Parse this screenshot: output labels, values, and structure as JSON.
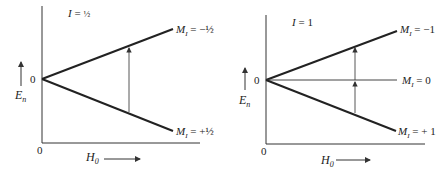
{
  "panels": [
    {
      "id": "left",
      "spin_label": "I = ½",
      "spin_I": "I",
      "spin_eq": " = ",
      "spin_value": "½",
      "y_axis_label": "E",
      "y_axis_sub": "n",
      "x_axis_label": "H",
      "x_axis_sub": "0",
      "origin_y_label": "0",
      "origin_x_label": "0",
      "levels": [
        {
          "M": "M",
          "sub": "I",
          "value": " = −½",
          "direction": "up"
        },
        {
          "M": "M",
          "sub": "I",
          "value": " = +½",
          "direction": "down"
        }
      ],
      "transition_arrow": "single"
    },
    {
      "id": "right",
      "spin_label": "I = 1",
      "spin_I": "I",
      "spin_eq": " = ",
      "spin_value": "1",
      "y_axis_label": "E",
      "y_axis_sub": "n",
      "x_axis_label": "H",
      "x_axis_sub": "0",
      "origin_y_label": "0",
      "origin_x_label": "0",
      "levels": [
        {
          "M": "M",
          "sub": "I",
          "value": " = −1",
          "direction": "up"
        },
        {
          "M": "M",
          "sub": "I",
          "value": " = 0",
          "direction": "flat"
        },
        {
          "M": "M",
          "sub": "I",
          "value": " = + 1",
          "direction": "down"
        }
      ],
      "transition_arrow": "double"
    }
  ],
  "colors": {
    "line": "#222222",
    "thin": "#444444",
    "background": "#ffffff"
  }
}
